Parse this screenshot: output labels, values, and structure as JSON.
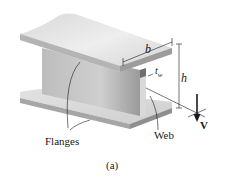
{
  "figure": {
    "caption": "(a)",
    "labels": {
      "width": "b",
      "height": "h",
      "web_thickness_base": "t",
      "web_thickness_sub": "w",
      "shear_force": "V",
      "flanges": "Flanges",
      "web": "Web"
    },
    "colors": {
      "background": "#ffffff",
      "steel_light": "#e4e4e4",
      "steel_mid": "#c8c8c8",
      "steel_dark": "#8e8e8e",
      "line": "#1a1a1a"
    }
  }
}
